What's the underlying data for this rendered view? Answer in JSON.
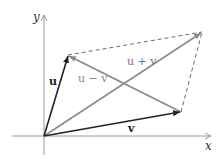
{
  "figure": {
    "type": "vector-parallelogram",
    "axes": {
      "x_label": "x",
      "y_label": "y"
    },
    "vectors": [
      {
        "id": "u",
        "label": "u",
        "from": [
          44,
          136
        ],
        "to": [
          68,
          55
        ],
        "color": "#222222",
        "style": "solid"
      },
      {
        "id": "v",
        "label": "v",
        "from": [
          44,
          136
        ],
        "to": [
          181,
          112
        ],
        "color": "#222222",
        "style": "solid"
      },
      {
        "id": "u_plus_v",
        "label": "u + v",
        "from": [
          44,
          136
        ],
        "to": [
          202,
          32
        ],
        "color": "#8a8a8a",
        "style": "solid"
      },
      {
        "id": "u_minus_v",
        "label": "u − v",
        "from": [
          181,
          112
        ],
        "to": [
          68,
          55
        ],
        "color": "#8a8a8a",
        "style": "solid"
      }
    ],
    "dashed_edges": [
      {
        "from": [
          68,
          55
        ],
        "to": [
          202,
          32
        ]
      },
      {
        "from": [
          181,
          112
        ],
        "to": [
          202,
          32
        ]
      }
    ],
    "colors": {
      "axis": "#9a9a9a",
      "dark_vector": "#222222",
      "gray_vector": "#8a8a8a",
      "dashed": "#6a6a6a"
    }
  }
}
